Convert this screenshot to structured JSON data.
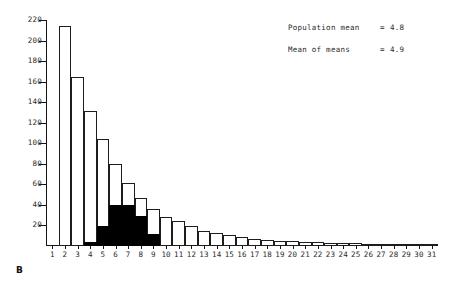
{
  "panel_letter": "B",
  "annotations": [
    {
      "label": "Population mean",
      "eq": "=",
      "value": "4.8"
    },
    {
      "label": "Mean of means",
      "eq": "=",
      "value": "4.9"
    }
  ],
  "chart_data": {
    "type": "bar",
    "title": "",
    "subtitle": "",
    "xlabel": "",
    "ylabel": "",
    "grid": false,
    "legend_position": "none",
    "xlim": [
      0.5,
      31.5
    ],
    "ylim": [
      0,
      220
    ],
    "ytick_labels": [
      "220",
      "200",
      "180",
      "160",
      "140",
      "120",
      "100",
      "80",
      "60",
      "40",
      "20"
    ],
    "ytick_values": [
      220,
      200,
      180,
      160,
      140,
      120,
      100,
      80,
      60,
      40,
      20
    ],
    "categories": [
      "1",
      "2",
      "3",
      "4",
      "5",
      "6",
      "7",
      "8",
      "9",
      "10",
      "11",
      "12",
      "13",
      "14",
      "15",
      "16",
      "17",
      "18",
      "19",
      "20",
      "21",
      "22",
      "23",
      "24",
      "25",
      "26",
      "27",
      "28",
      "29",
      "30",
      "31"
    ],
    "series": [
      {
        "name": "Sampling distribution (outline)",
        "style": "outline",
        "color": "#ffffff",
        "edge_color": "#1d1d1d",
        "values": [
          0,
          214,
          165,
          131,
          104,
          80,
          61,
          47,
          36,
          28,
          24,
          19,
          15,
          13,
          11,
          9,
          7,
          6,
          5,
          5,
          4,
          4,
          3,
          3,
          3,
          2,
          2,
          2,
          2,
          2,
          2
        ]
      },
      {
        "name": "Population distribution (filled)",
        "style": "filled",
        "color": "#000000",
        "edge_color": "#000000",
        "values": [
          0,
          0,
          0,
          4,
          19,
          40,
          40,
          29,
          12,
          0,
          0,
          0,
          0,
          0,
          0,
          0,
          0,
          0,
          0,
          0,
          0,
          0,
          0,
          0,
          0,
          0,
          0,
          0,
          0,
          0,
          0
        ]
      }
    ],
    "annotation_text": [
      "Population mean = 4.8",
      "Mean of means   = 4.9"
    ]
  }
}
